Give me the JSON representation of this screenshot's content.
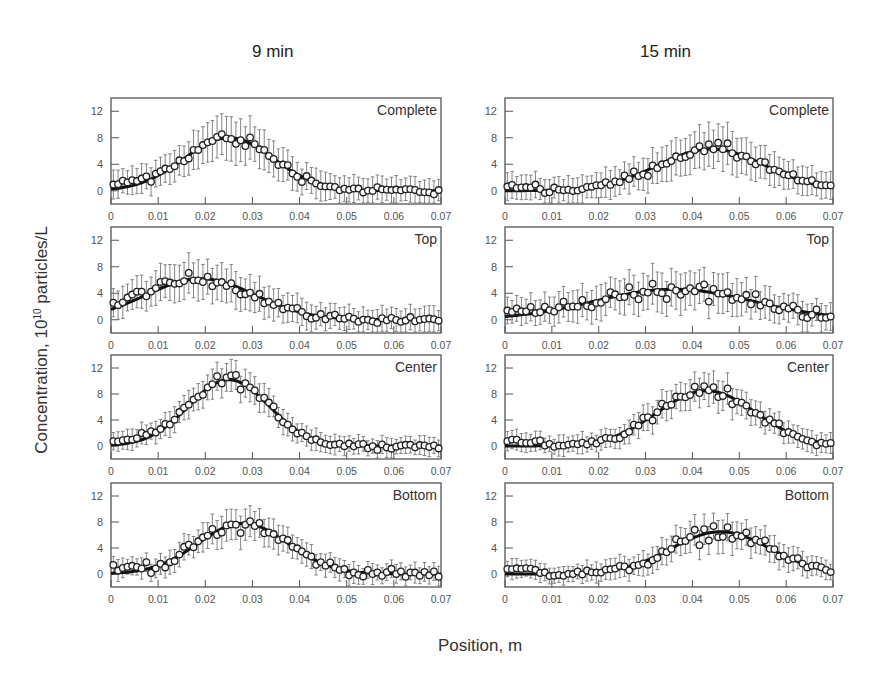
{
  "figure": {
    "column_titles": [
      "9 min",
      "15 min"
    ],
    "ylabel_prefix": "Concentration, 10",
    "ylabel_exponent": "10",
    "ylabel_suffix": " particles/L",
    "xlabel": "Position, m"
  },
  "chart_data": {
    "type": "scatter",
    "layout": "4 rows x 2 columns of panels, points with error bars plus fitted line",
    "xlabel": "Position, m",
    "ylabel": "Concentration, 10^10 particles/L",
    "xlim": [
      0,
      0.07
    ],
    "ylim": [
      -2,
      14
    ],
    "xticks": [
      0,
      0.01,
      0.02,
      0.03,
      0.04,
      0.05,
      0.06,
      0.07
    ],
    "xtick_labels": [
      "0",
      "0.01",
      "0.02",
      "0.03",
      "0.04",
      "0.05",
      "0.06",
      "0.07"
    ],
    "yticks": [
      0,
      4,
      8,
      12
    ],
    "ytick_labels": [
      "0",
      "4",
      "8",
      "12"
    ],
    "grid": false,
    "columns": [
      {
        "title": "9 min",
        "panels": [
          {
            "label": "Complete",
            "fit": {
              "peak_x": 0.025,
              "peak_y": 8.0,
              "sigma": 0.0095,
              "baseline": 0.0
            },
            "err": 2.8,
            "noise": 0.8
          },
          {
            "label": "Top",
            "fit": {
              "peak_x": 0.019,
              "peak_y": 6.2,
              "sigma": 0.0115,
              "baseline": 0.0
            },
            "err": 2.6,
            "noise": 0.8
          },
          {
            "label": "Center",
            "fit": {
              "peak_x": 0.025,
              "peak_y": 10.2,
              "sigma": 0.0085,
              "baseline": 0.0
            },
            "err": 2.0,
            "noise": 0.7
          },
          {
            "label": "Bottom",
            "fit": {
              "peak_x": 0.028,
              "peak_y": 7.8,
              "sigma": 0.0095,
              "baseline": 0.0
            },
            "err": 2.0,
            "noise": 0.9
          }
        ]
      },
      {
        "title": "15 min",
        "panels": [
          {
            "label": "Complete",
            "fit": {
              "peak_x": 0.044,
              "peak_y": 6.3,
              "sigma": 0.0115,
              "baseline": 0.0
            },
            "err": 2.8,
            "noise": 0.7
          },
          {
            "label": "Top",
            "fit": {
              "peak_x": 0.036,
              "peak_y": 4.6,
              "sigma": 0.017,
              "baseline": 0.0
            },
            "err": 2.6,
            "noise": 1.0
          },
          {
            "label": "Center",
            "fit": {
              "peak_x": 0.043,
              "peak_y": 8.5,
              "sigma": 0.0105,
              "baseline": 0.0
            },
            "err": 2.0,
            "noise": 0.8
          },
          {
            "label": "Bottom",
            "fit": {
              "peak_x": 0.046,
              "peak_y": 6.5,
              "sigma": 0.0105,
              "baseline": 0.0
            },
            "err": 2.0,
            "noise": 0.9
          }
        ]
      }
    ],
    "points_per_panel": 70
  }
}
